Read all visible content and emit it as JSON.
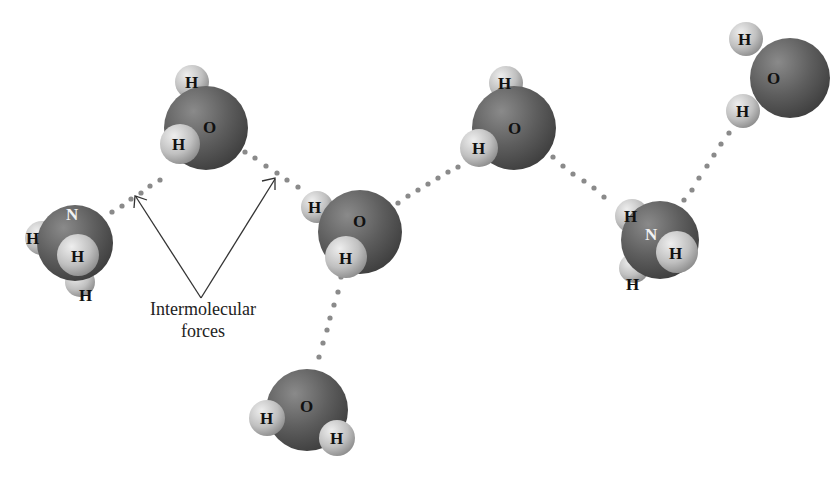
{
  "diagram": {
    "caption": {
      "line1": "Intermolecular",
      "line2": "forces"
    },
    "colors": {
      "heavy_atom": "#5e5e5e",
      "hydrogen": "#c4c4c4",
      "bond_dots": "#8a8a8a",
      "arrow": "#333333",
      "background": "#ffffff"
    },
    "molecules": [
      {
        "id": "ammonia-left",
        "formula": "NH3",
        "central": "N",
        "hydrogens": [
          "H",
          "H",
          "H"
        ]
      },
      {
        "id": "water-upper-left",
        "formula": "H2O",
        "central": "O",
        "hydrogens": [
          "H",
          "H"
        ]
      },
      {
        "id": "water-center",
        "formula": "H2O",
        "central": "O",
        "hydrogens": [
          "H",
          "H"
        ]
      },
      {
        "id": "water-upper-middle",
        "formula": "H2O",
        "central": "O",
        "hydrogens": [
          "H",
          "H"
        ]
      },
      {
        "id": "ammonia-right",
        "formula": "NH3",
        "central": "N",
        "hydrogens": [
          "H",
          "H",
          "H"
        ]
      },
      {
        "id": "water-top-right",
        "formula": "H2O",
        "central": "O",
        "hydrogens": [
          "H",
          "H"
        ]
      },
      {
        "id": "water-bottom",
        "formula": "H2O",
        "central": "O",
        "hydrogens": [
          "H",
          "H"
        ]
      }
    ],
    "labels": {
      "N": "N",
      "O": "O",
      "H": "H"
    }
  }
}
